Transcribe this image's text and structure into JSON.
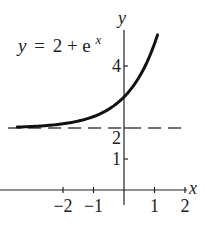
{
  "chart_data": {
    "type": "line",
    "equation": {
      "lhs": "y",
      "eq": "=",
      "rhs_base": "2 + e",
      "rhs_exp": "x"
    },
    "xlabel": "x",
    "ylabel": "y",
    "xlim": [
      -4,
      2.2
    ],
    "ylim": [
      0,
      5.2
    ],
    "x_ticks": [
      {
        "value": -2,
        "label": "−2"
      },
      {
        "value": -1,
        "label": "−1"
      },
      {
        "value": 1,
        "label": "1"
      },
      {
        "value": 2,
        "label": "2"
      }
    ],
    "y_ticks": [
      {
        "value": 1,
        "label": "1"
      },
      {
        "value": 2,
        "label": "2"
      },
      {
        "value": 4,
        "label": "4"
      }
    ],
    "series": [
      {
        "name": "y = 2 + e^x",
        "style": "solid",
        "x": [
          -3.5,
          -3,
          -2.5,
          -2,
          -1.5,
          -1,
          -0.5,
          0,
          0.25,
          0.5,
          0.75,
          1.0,
          1.1
        ],
        "y": [
          2.03,
          2.05,
          2.08,
          2.14,
          2.22,
          2.37,
          2.61,
          3.0,
          3.28,
          3.65,
          4.12,
          4.72,
          5.0
        ]
      },
      {
        "name": "asymptote y = 2",
        "style": "dashed",
        "x": [
          -3.8,
          1.9
        ],
        "y": [
          2,
          2
        ]
      }
    ],
    "grid": false,
    "legend": "none",
    "colors": {
      "curve": "#111111",
      "axis": "#222222",
      "asymptote": "#444444"
    }
  }
}
